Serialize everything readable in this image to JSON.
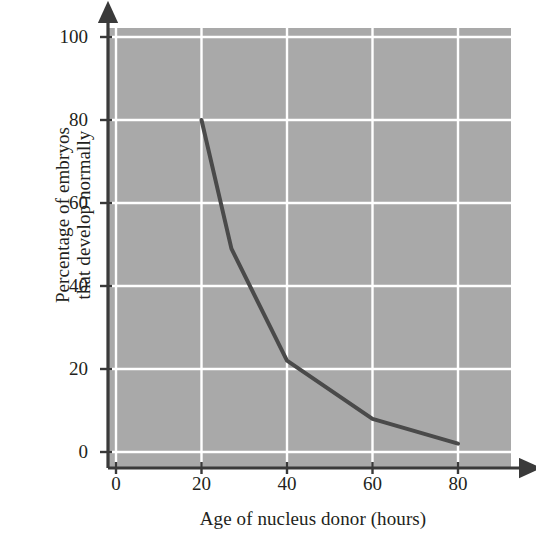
{
  "chart_data": {
    "type": "line",
    "title": "",
    "xlabel": "Age of nucleus donor (hours)",
    "ylabel": "Percentage of embryos that develop normally",
    "ylabel_line1": "Percentage of embryos",
    "ylabel_line2": "that develop normally",
    "xlim": [
      0,
      90
    ],
    "ylim": [
      0,
      100
    ],
    "xticks": [
      0,
      20,
      40,
      60,
      80
    ],
    "xtick_labels": [
      "0",
      "20",
      "40",
      "60",
      "80"
    ],
    "yticks": [
      0,
      20,
      40,
      60,
      80,
      100
    ],
    "ytick_labels": [
      "0",
      "20",
      "40",
      "60",
      "80",
      "100"
    ],
    "grid": true,
    "grid_color": "#ffffff",
    "plot_bgcolor": "#a9a9a9",
    "figure_bgcolor": "#ffffff",
    "axis_color": "#3a3a3a",
    "legend": "none",
    "series": [
      {
        "name": "Percentage of embryos that develop normally",
        "color": "#4a4a4a",
        "line_width": 4,
        "x": [
          20,
          27,
          40,
          60,
          80
        ],
        "y": [
          80,
          49,
          22,
          8,
          2
        ]
      }
    ]
  },
  "axes": {
    "x_tick_marks": [
      0,
      20,
      40,
      60,
      80
    ],
    "y_tick_marks": [
      0,
      20,
      40,
      60,
      80,
      100
    ],
    "x_arrow": true,
    "y_arrow": true
  }
}
